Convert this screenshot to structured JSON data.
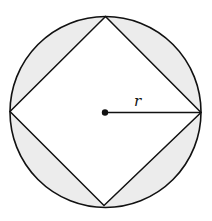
{
  "diagram": {
    "radius_label": "r",
    "colors": {
      "stroke": "#111111",
      "shaded": "#ececec",
      "background": "#ffffff"
    },
    "circle": {
      "cx": 105.5,
      "cy": 112,
      "r": 95.5
    },
    "square_vertices": [
      {
        "name": "top",
        "x": 105.5,
        "y": 16.5
      },
      {
        "name": "right",
        "x": 201,
        "y": 112.5
      },
      {
        "name": "bottom",
        "x": 104,
        "y": 205.5
      },
      {
        "name": "left",
        "x": 10,
        "y": 111.5
      }
    ],
    "center_point": {
      "x": 105,
      "y": 112.5
    },
    "radius_segment": {
      "x1": 105,
      "y1": 112.5,
      "x2": 201,
      "y2": 112.5
    },
    "label_position": {
      "x": 137,
      "y": 106
    }
  }
}
